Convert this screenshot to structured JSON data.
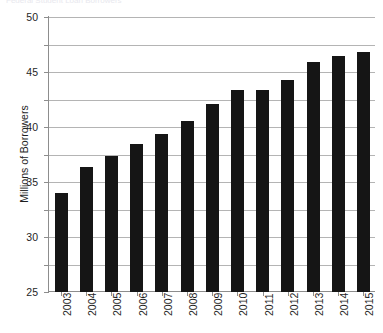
{
  "clipped_header": "Federal Student Loan Borrowers",
  "chart_data": {
    "type": "bar",
    "title": "",
    "xlabel": "",
    "ylabel": "Millions of Borrowers",
    "categories": [
      "2003",
      "2004",
      "2005",
      "2006",
      "2007",
      "2008",
      "2009",
      "2010",
      "2011",
      "2012",
      "2013",
      "2014",
      "2015"
    ],
    "values": [
      18.0,
      22.7,
      24.7,
      27.0,
      28.7,
      31.1,
      34.1,
      36.8,
      36.7,
      38.5,
      41.8,
      42.9,
      43.7
    ],
    "ylim": [
      0,
      50
    ],
    "ytick_values": [
      0,
      5,
      10,
      15,
      20,
      25,
      30,
      35,
      40,
      45,
      50
    ],
    "ytick_labels": [
      "0",
      "5",
      "10",
      "15",
      "20",
      "25",
      "30",
      "35",
      "40",
      "45",
      "50"
    ],
    "grid": true,
    "legend": false,
    "bar_color": "#151515",
    "grid_color": "#b4b4b4",
    "axis_color": "#8d8d8d",
    "background_color": "#ffffff"
  }
}
